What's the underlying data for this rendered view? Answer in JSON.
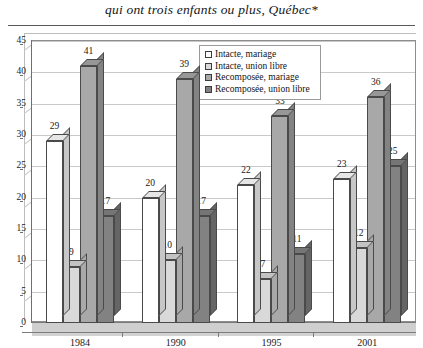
{
  "title": "qui ont trois enfants ou plus, Québec*",
  "legend": {
    "position": "top-center-inside",
    "entries": [
      {
        "label": "Intacte, mariage",
        "color": "#ffffff"
      },
      {
        "label": "Intacte, union libre",
        "color": "#d9d9d9"
      },
      {
        "label": "Recomposée, mariage",
        "color": "#a8a8a8"
      },
      {
        "label": "Recomposée, union libre",
        "color": "#828282"
      }
    ]
  },
  "axes": {
    "y_ticks": [
      "0",
      "5",
      "10",
      "15",
      "20",
      "25",
      "30",
      "35",
      "40",
      "45"
    ],
    "x_ticks": [
      "1984",
      "1990",
      "1995",
      "2001"
    ]
  },
  "chart_data": {
    "type": "bar",
    "title": "qui ont trois enfants ou plus, Québec*",
    "xlabel": "",
    "ylabel": "",
    "ylim": [
      0,
      45
    ],
    "ytick_step": 5,
    "grid": true,
    "legend_position": "top-center",
    "categories": [
      "1984",
      "1990",
      "1995",
      "2001"
    ],
    "series": [
      {
        "name": "Intacte, mariage",
        "color": "#ffffff",
        "values": [
          29,
          20,
          22,
          23
        ]
      },
      {
        "name": "Intacte, union libre",
        "color": "#d9d9d9",
        "values": [
          9,
          10,
          7,
          12
        ]
      },
      {
        "name": "Recomposée, mariage",
        "color": "#a8a8a8",
        "values": [
          41,
          39,
          33,
          36
        ]
      },
      {
        "name": "Recomposée, union libre",
        "color": "#828282",
        "values": [
          17,
          17,
          11,
          25
        ]
      }
    ]
  }
}
